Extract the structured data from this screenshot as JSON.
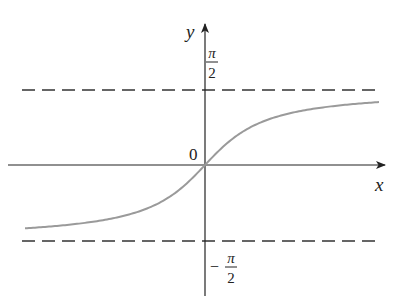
{
  "chart_data": {
    "type": "line",
    "title": "",
    "function": "y = arctan(x)",
    "xlabel": "x",
    "ylabel": "y",
    "origin_label": "0",
    "asymptotes": [
      {
        "y_label_num": "π",
        "y_label_den": "2",
        "sign": "",
        "value": 1.5708
      },
      {
        "y_label_num": "π",
        "y_label_den": "2",
        "sign": "−",
        "value": -1.5708
      }
    ],
    "series": [
      {
        "name": "arctan",
        "x": [
          -4,
          -3,
          -2,
          -1,
          0,
          1,
          2,
          3,
          4
        ],
        "values": [
          -1.33,
          -1.25,
          -1.11,
          -0.79,
          0,
          0.79,
          1.11,
          1.25,
          1.33
        ]
      }
    ],
    "grid": false,
    "colors": {
      "curve": "#9a9a9a",
      "axes": "#222222",
      "asymptote": "#333333"
    }
  },
  "labels": {
    "y_axis": "y",
    "x_axis": "x",
    "origin": "0",
    "upper_num": "π",
    "upper_den": "2",
    "lower_sign": "−",
    "lower_num": "π",
    "lower_den": "2"
  }
}
